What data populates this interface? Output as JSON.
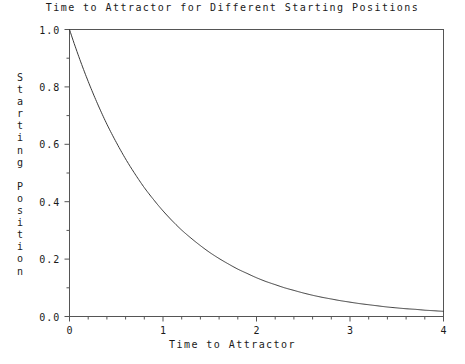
{
  "chart_data": {
    "type": "line",
    "title": "Time to Attractor for Different Starting Positions",
    "xlabel": "Time to Attractor",
    "ylabel": "Starting Position",
    "xlim": [
      0,
      4
    ],
    "ylim": [
      0.0,
      1.0
    ],
    "grid": false,
    "legend": null,
    "frame": "box",
    "tick_direction": "out",
    "line_color": "#3a3a3a",
    "background_color": "#ffffff",
    "xticks": [
      0,
      1,
      2,
      3,
      4
    ],
    "xtick_labels": [
      "0",
      "1",
      "2",
      "3",
      "4"
    ],
    "xminor_step": 0.2,
    "yticks": [
      0.0,
      0.2,
      0.4,
      0.6,
      0.8,
      1.0
    ],
    "ytick_labels": [
      "0.0",
      "0.2",
      "0.4",
      "0.6",
      "0.8",
      "1.0"
    ],
    "yminor_step": 0.1,
    "series": [
      {
        "name": "exponential decay",
        "equation": "y = exp(-t)",
        "x": [
          0.0,
          0.1,
          0.2,
          0.3,
          0.4,
          0.5,
          0.6,
          0.7,
          0.8,
          0.9,
          1.0,
          1.1,
          1.2,
          1.3,
          1.4,
          1.5,
          1.6,
          1.7,
          1.8,
          1.9,
          2.0,
          2.1,
          2.2,
          2.3,
          2.4,
          2.5,
          2.6,
          2.7,
          2.8,
          2.9,
          3.0,
          3.1,
          3.2,
          3.3,
          3.4,
          3.5,
          3.6,
          3.7,
          3.8,
          3.9,
          4.0
        ],
        "y": [
          1.0,
          0.905,
          0.819,
          0.741,
          0.67,
          0.607,
          0.549,
          0.497,
          0.449,
          0.407,
          0.368,
          0.333,
          0.301,
          0.273,
          0.247,
          0.223,
          0.202,
          0.183,
          0.165,
          0.15,
          0.135,
          0.122,
          0.111,
          0.1,
          0.091,
          0.082,
          0.074,
          0.067,
          0.061,
          0.055,
          0.05,
          0.045,
          0.041,
          0.037,
          0.033,
          0.03,
          0.027,
          0.025,
          0.022,
          0.02,
          0.018
        ]
      }
    ]
  },
  "ylabel_chars": [
    "S",
    "t",
    "a",
    "r",
    "t",
    "i",
    "n",
    "g",
    " ",
    "P",
    "o",
    "s",
    "i",
    "t",
    "i",
    "o",
    "n"
  ]
}
